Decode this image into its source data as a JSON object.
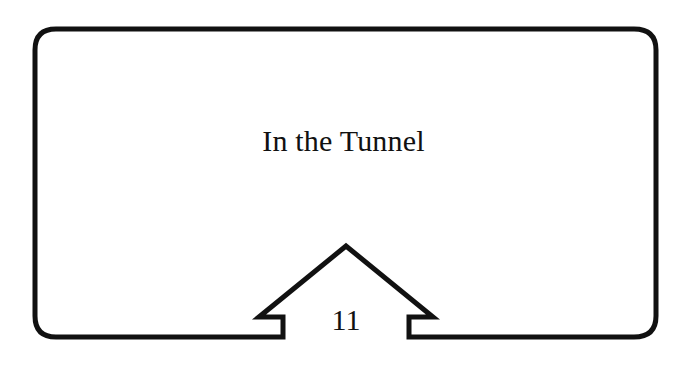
{
  "card": {
    "title": "In the Tunnel",
    "page_number": "11",
    "stroke_color": "#111111",
    "background_color": "#ffffff"
  },
  "decorations": {
    "frame_shape": "rounded-rectangle",
    "tab_shape": "house-arrow"
  }
}
